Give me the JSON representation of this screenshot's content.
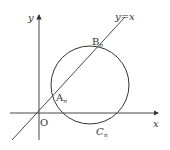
{
  "diagram": {
    "type": "coordinate-geometry",
    "axes": {
      "x_label": "x",
      "y_label": "y",
      "origin_label": "O"
    },
    "line": {
      "label": "y = x",
      "label_y": "y",
      "label_eq": "=",
      "label_x": "x"
    },
    "circle": {
      "label_main": "C",
      "label_sub": "n"
    },
    "points": [
      {
        "name": "A",
        "sub": "n"
      },
      {
        "name": "B",
        "sub": "n"
      }
    ],
    "colors": {
      "stroke": "#333333",
      "background": "#ffffff"
    }
  }
}
